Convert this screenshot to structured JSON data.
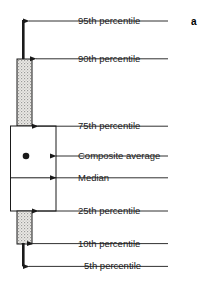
{
  "figure": {
    "panel_letter": "a",
    "type": "box-and-whisker-plot-legend",
    "colors": {
      "outline": "#1a1a1a",
      "fill_box": "#ffffff",
      "fill_stipple": "#e8e6e1",
      "stipple_dot": "#8a8a8a",
      "text": "#1a1a1a",
      "background": "#ffffff"
    },
    "annotations": [
      {
        "id": "p95",
        "label": "95th percentile",
        "label_x": 78,
        "label_y": 17,
        "arrow_y": 21,
        "arrow_tip_x": 28,
        "leader_x": 168
      },
      {
        "id": "p90",
        "label": "90th percentile",
        "label_x": 78,
        "label_y": 55,
        "arrow_y": 59,
        "arrow_tip_x": 36,
        "leader_x": 168
      },
      {
        "id": "p75",
        "label": "75th percentile",
        "label_x": 78,
        "label_y": 122,
        "arrow_y": 126,
        "arrow_tip_x": 38,
        "leader_x": 168
      },
      {
        "id": "composite",
        "label": "Composite average",
        "label_x": 78,
        "label_y": 152,
        "arrow_y": 156,
        "arrow_tip_x": 56,
        "leader_x": 168
      },
      {
        "id": "median",
        "label": "Median",
        "label_x": 78,
        "label_y": 174,
        "arrow_y": 178,
        "arrow_tip_x": 56,
        "leader_x": 168
      },
      {
        "id": "p25",
        "label": "25th percentile",
        "label_x": 78,
        "label_y": 207,
        "arrow_y": 211,
        "arrow_tip_x": 38,
        "leader_x": 168
      },
      {
        "id": "p10",
        "label": "10th percentile",
        "label_x": 78,
        "label_y": 240,
        "arrow_y": 244,
        "arrow_tip_x": 33,
        "leader_x": 168
      },
      {
        "id": "p5",
        "label": "5th percentile",
        "label_x": 78,
        "label_y": 262,
        "arrow_y": 266,
        "arrow_tip_x": 28,
        "leader_x": 168
      }
    ],
    "glyph": {
      "upper_whisker": {
        "x": 23,
        "y_top": 21,
        "y_bottom": 59,
        "width": 2.6
      },
      "upper_stipple_box": {
        "x": 17,
        "y": 59,
        "width": 15,
        "height": 67
      },
      "main_box": {
        "x": 10,
        "y": 126,
        "width": 46,
        "height": 85
      },
      "median_line": {
        "x1": 10,
        "x2": 56,
        "y": 178
      },
      "composite_dot": {
        "cx": 26,
        "cy": 156,
        "r": 3.2
      },
      "lower_stipple_box": {
        "x": 17,
        "y": 211,
        "width": 15,
        "height": 33
      },
      "lower_whisker": {
        "x": 23,
        "y_top": 244,
        "y_bottom": 266,
        "width": 2.6
      }
    }
  }
}
